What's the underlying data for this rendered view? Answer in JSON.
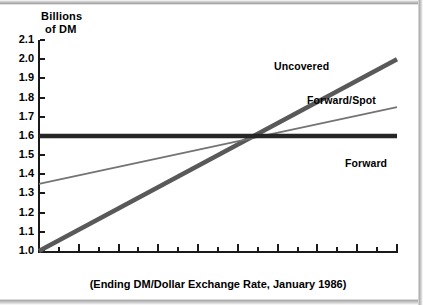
{
  "chart_data": {
    "type": "line",
    "title": "",
    "ylabel": "Billions of DM",
    "ylabel_line1": "Billions",
    "ylabel_line2": "of DM",
    "xlabel": "(Ending DM/Dollar Exchange Rate, January 1986)",
    "xlim": [
      2.2,
      4.0
    ],
    "ylim": [
      1.0,
      2.1
    ],
    "grid": false,
    "legend_position": "inline-right",
    "yticks": [
      1.0,
      1.1,
      1.2,
      1.3,
      1.4,
      1.5,
      1.6,
      1.7,
      1.8,
      1.9,
      2.0,
      2.1
    ],
    "ytick_labels": [
      "1.0",
      "1.1",
      "1.2",
      "1.3",
      "1.4",
      "1.5",
      "1.6",
      "1.7",
      "1.8",
      "1.9",
      "2.0",
      "2.1"
    ],
    "xticks_major": [
      2.2,
      2.4,
      2.6,
      2.8,
      3.0,
      3.2,
      3.4,
      3.6,
      3.8,
      4.0
    ],
    "xtick_labels": [
      "2.2",
      "2.4",
      "2.6",
      "2.8",
      "3.0",
      "3.2",
      "3.4",
      "3.6",
      "3.8",
      "4.0"
    ],
    "xticks_minor": [
      2.3,
      2.5,
      2.7,
      2.9,
      3.1,
      3.3,
      3.5,
      3.7,
      3.9
    ],
    "series": [
      {
        "name": "Uncovered",
        "color": "#595959",
        "width": 4.5,
        "x": [
          2.2,
          4.0
        ],
        "values": [
          1.0,
          2.0
        ]
      },
      {
        "name": "Forward/Spot",
        "color": "#737373",
        "width": 1.6,
        "x": [
          2.2,
          4.0
        ],
        "values": [
          1.35,
          1.75
        ]
      },
      {
        "name": "Forward",
        "color": "#262626",
        "width": 4.5,
        "x": [
          2.2,
          4.0
        ],
        "values": [
          1.6,
          1.6
        ]
      }
    ],
    "intersection": {
      "x": 3.2,
      "y": 1.6
    }
  },
  "labels": {
    "uncovered": "Uncovered",
    "forward_spot": "Forward/Spot",
    "forward": "Forward"
  }
}
